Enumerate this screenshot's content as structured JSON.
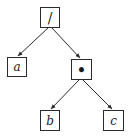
{
  "diagram": {
    "type": "expression-tree",
    "nodes": {
      "root": {
        "label": "/",
        "x": 40,
        "y": 7,
        "w": 20,
        "h": 21
      },
      "a": {
        "label": "a",
        "x": 7,
        "y": 57,
        "w": 20,
        "h": 20
      },
      "mul": {
        "label": "•",
        "x": 71,
        "y": 59,
        "w": 21,
        "h": 21
      },
      "b": {
        "label": "b",
        "x": 40,
        "y": 110,
        "w": 20,
        "h": 21
      },
      "c": {
        "label": "c",
        "x": 103,
        "y": 110,
        "w": 21,
        "h": 21
      }
    },
    "edges": [
      {
        "from": "root",
        "to": "a"
      },
      {
        "from": "root",
        "to": "mul"
      },
      {
        "from": "mul",
        "to": "b"
      },
      {
        "from": "mul",
        "to": "c"
      }
    ],
    "colors": {
      "stroke": "#2a2a2a",
      "background": "#ffffff",
      "text": "#1a1a1a"
    }
  }
}
